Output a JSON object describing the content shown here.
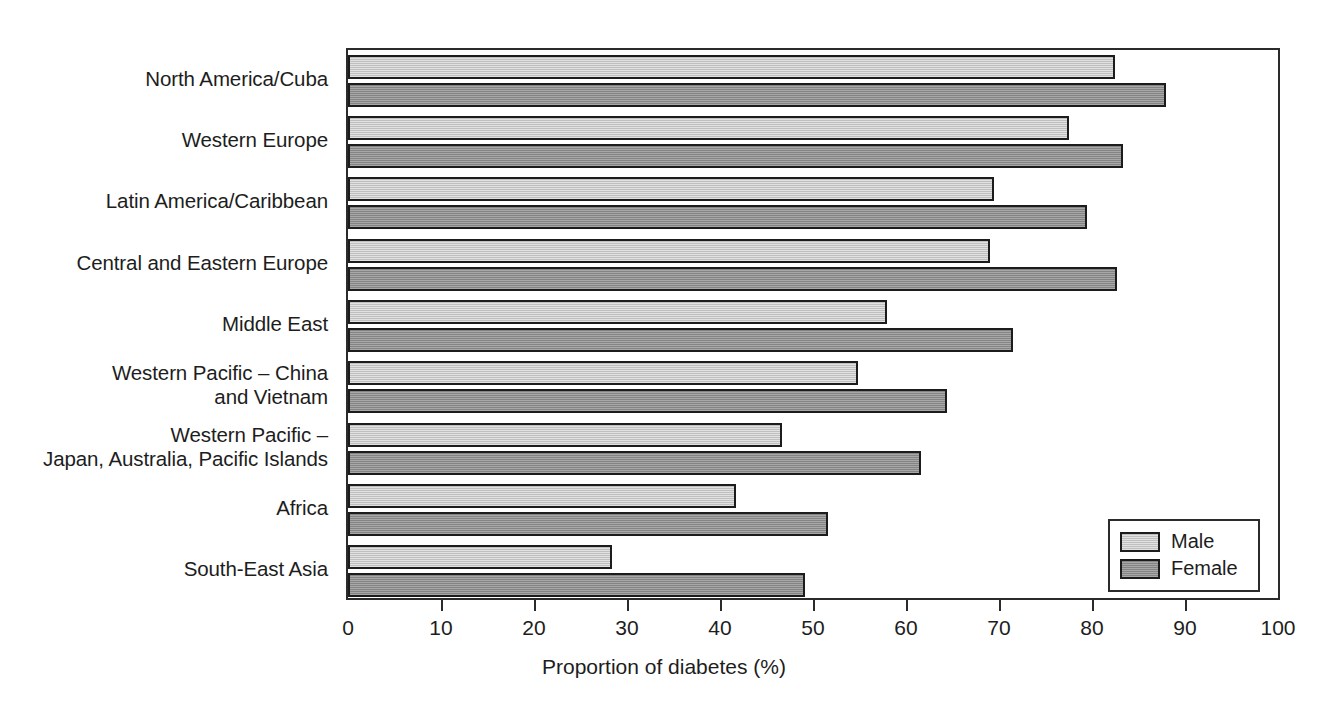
{
  "chart_data": {
    "type": "bar",
    "orientation": "horizontal",
    "title": "",
    "xlabel": "Proportion of diabetes (%)",
    "ylabel": "",
    "xlim": [
      0,
      100
    ],
    "xticks": [
      0,
      10,
      20,
      30,
      40,
      50,
      60,
      70,
      80,
      90,
      100
    ],
    "grid": false,
    "legend_position": "bottom-right",
    "categories": [
      "North America/Cuba",
      "Western Europe",
      "Latin America/Caribbean",
      "Central and Eastern Europe",
      "Middle East",
      "Western Pacific – China\nand Vietnam",
      "Western Pacific –\nJapan, Australia, Pacific Islands",
      "Africa",
      "South-East Asia"
    ],
    "series": [
      {
        "name": "Male",
        "color": "#c9c9c9",
        "values": [
          82.5,
          77.5,
          69.5,
          69.0,
          58.0,
          54.8,
          46.7,
          41.7,
          28.4
        ]
      },
      {
        "name": "Female",
        "color": "#8f8f8f",
        "values": [
          88.0,
          83.3,
          79.5,
          82.7,
          71.5,
          64.4,
          61.6,
          51.6,
          49.1
        ]
      }
    ]
  },
  "legend": {
    "entries": [
      {
        "label": "Male"
      },
      {
        "label": "Female"
      }
    ]
  },
  "axis": {
    "x_label": "Proportion of diabetes (%)",
    "tick_labels": [
      "0",
      "10",
      "20",
      "30",
      "40",
      "50",
      "60",
      "70",
      "80",
      "90",
      "100"
    ]
  }
}
